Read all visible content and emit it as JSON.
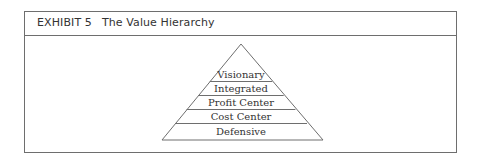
{
  "exhibit": {
    "label": "EXHIBIT 5",
    "title": "The Value Hierarchy"
  },
  "pyramid": {
    "levels_top_to_bottom": [
      "Visionary",
      "Integrated",
      "Profit Center",
      "Cost Center",
      "Defensive"
    ]
  },
  "colors": {
    "line": "#6e6e6e",
    "text": "#333333",
    "background": "#ffffff"
  }
}
